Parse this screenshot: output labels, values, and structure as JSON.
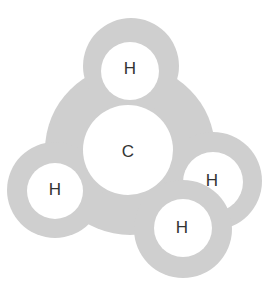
{
  "diagram": {
    "colors": {
      "shell": "#cfcfcf",
      "core": "#ffffff",
      "text": "#333333"
    },
    "atoms": [
      {
        "id": "carbon",
        "label": "C"
      },
      {
        "id": "h-top",
        "label": "H"
      },
      {
        "id": "h-left",
        "label": "H"
      },
      {
        "id": "h-right-back",
        "label": "H"
      },
      {
        "id": "h-front",
        "label": "H"
      }
    ]
  }
}
